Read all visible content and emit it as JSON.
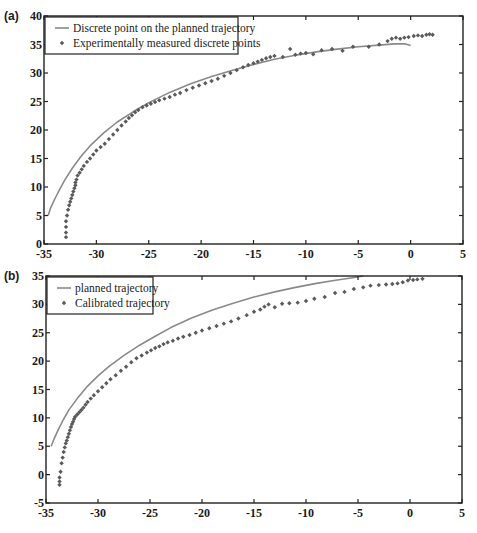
{
  "figure": {
    "panels": [
      "(a)",
      "(b)"
    ]
  },
  "colors": {
    "axis": "#222222",
    "line": "#8a8a8a",
    "marker": "#5a5a5a"
  },
  "chart_data": [
    {
      "type": "scatter",
      "panel_label": "(a)",
      "title": "",
      "xlabel": "",
      "ylabel": "",
      "xlim": [
        -35,
        5
      ],
      "ylim": [
        0,
        40
      ],
      "xticks": [
        -35,
        -30,
        -25,
        -20,
        -15,
        -10,
        -5,
        0,
        5
      ],
      "yticks": [
        0,
        5,
        10,
        15,
        20,
        25,
        30,
        35,
        40
      ],
      "grid": false,
      "legend_position": "upper left",
      "frame": {
        "left": 44,
        "right": 463,
        "top": 16,
        "bottom": 244
      },
      "legend": {
        "x": 45,
        "y": 17,
        "w": 193,
        "h": 37
      },
      "series": [
        {
          "name": "Discrete point on the planned trajectory",
          "kind": "line",
          "x": [
            -34.6,
            -34.4,
            -34.0,
            -33.5,
            -33.0,
            -32.3,
            -31.5,
            -30.5,
            -29.3,
            -28.0,
            -26.5,
            -25.0,
            -23.0,
            -21.0,
            -19.0,
            -17.0,
            -15.0,
            -13.0,
            -11.0,
            -9.0,
            -7.0,
            -5.0,
            -3.0,
            -1.5,
            -0.5,
            0.0
          ],
          "y": [
            5.0,
            6.2,
            7.8,
            9.6,
            11.3,
            13.3,
            15.3,
            17.4,
            19.5,
            21.4,
            23.2,
            24.8,
            26.6,
            28.1,
            29.4,
            30.5,
            31.5,
            32.4,
            33.1,
            33.7,
            34.2,
            34.6,
            34.9,
            35.1,
            35.1,
            34.8
          ]
        },
        {
          "name": "Experimentally measured discrete points",
          "kind": "scatter",
          "x": [
            -32.9,
            -32.9,
            -32.9,
            -32.9,
            -32.8,
            -32.7,
            -32.6,
            -32.5,
            -32.4,
            -32.3,
            -32.2,
            -32.1,
            -32.0,
            -32.0,
            -31.9,
            -31.8,
            -31.6,
            -31.4,
            -31.2,
            -30.9,
            -30.6,
            -30.3,
            -30.0,
            -29.6,
            -29.2,
            -28.8,
            -28.4,
            -28.0,
            -27.6,
            -27.2,
            -26.9,
            -26.6,
            -26.3,
            -26.0,
            -25.6,
            -25.2,
            -24.8,
            -24.4,
            -24.0,
            -23.5,
            -23.0,
            -22.5,
            -22.0,
            -21.4,
            -20.8,
            -20.2,
            -19.6,
            -19.0,
            -18.4,
            -17.8,
            -17.2,
            -16.6,
            -16.0,
            -15.5,
            -15.0,
            -14.6,
            -14.2,
            -13.8,
            -13.4,
            -13.0,
            -12.2,
            -11.5,
            -11.0,
            -10.5,
            -10.0,
            -9.3,
            -8.5,
            -7.5,
            -6.5,
            -5.5,
            -4.0,
            -3.0,
            -2.2,
            -1.8,
            -1.4,
            -1.0,
            -0.6,
            -0.2,
            0.3,
            0.7,
            1.1,
            1.5,
            1.8,
            2.1
          ],
          "y": [
            1.2,
            2.0,
            3.0,
            4.0,
            5.0,
            6.0,
            6.8,
            7.4,
            8.0,
            8.6,
            9.2,
            9.8,
            10.3,
            10.8,
            11.3,
            12.0,
            12.5,
            13.1,
            13.7,
            14.4,
            15.0,
            15.7,
            16.4,
            17.0,
            17.6,
            18.4,
            19.2,
            20.0,
            20.8,
            21.5,
            22.1,
            22.6,
            23.1,
            23.5,
            24.0,
            24.3,
            24.6,
            24.9,
            25.2,
            25.5,
            25.8,
            26.2,
            26.5,
            27.0,
            27.4,
            27.8,
            28.2,
            28.6,
            29.0,
            29.5,
            30.0,
            30.5,
            31.0,
            31.4,
            31.7,
            32.0,
            32.3,
            32.6,
            32.8,
            33.0,
            32.8,
            34.2,
            33.2,
            33.4,
            33.5,
            33.3,
            34.0,
            34.2,
            33.9,
            34.6,
            34.6,
            35.0,
            35.6,
            36.0,
            36.2,
            36.0,
            36.2,
            36.3,
            36.5,
            36.6,
            36.5,
            36.7,
            36.8,
            36.7
          ]
        }
      ]
    },
    {
      "type": "scatter",
      "panel_label": "(b)",
      "title": "",
      "xlabel": "",
      "ylabel": "",
      "xlim": [
        -35,
        5
      ],
      "ylim": [
        -5,
        35
      ],
      "xticks": [
        -35,
        -30,
        -25,
        -20,
        -15,
        -10,
        -5,
        0,
        5
      ],
      "yticks": [
        -5,
        0,
        5,
        10,
        15,
        20,
        25,
        30,
        35
      ],
      "grid": false,
      "legend_position": "upper left",
      "frame": {
        "left": 46,
        "right": 462,
        "top": 276,
        "bottom": 503
      },
      "legend": {
        "x": 47,
        "y": 277,
        "w": 106,
        "h": 37
      },
      "series": [
        {
          "name": "planned trajectory",
          "kind": "line",
          "x": [
            -34.5,
            -34.2,
            -33.8,
            -33.3,
            -32.8,
            -32.0,
            -31.0,
            -30.0,
            -29.0,
            -27.5,
            -26.0,
            -24.5,
            -23.0,
            -21.0,
            -19.0,
            -17.0,
            -15.0,
            -13.0,
            -11.0,
            -9.0,
            -7.0,
            -5.5,
            -4.5
          ],
          "y": [
            5.0,
            6.4,
            8.0,
            9.8,
            11.4,
            13.4,
            15.6,
            17.4,
            19.0,
            21.0,
            22.8,
            24.4,
            25.9,
            27.6,
            29.0,
            30.2,
            31.3,
            32.2,
            33.0,
            33.7,
            34.3,
            34.7,
            35.0
          ]
        },
        {
          "name": "Calibrated trajectory",
          "kind": "scatter",
          "x": [
            -33.7,
            -33.7,
            -33.7,
            -33.6,
            -33.5,
            -33.4,
            -33.3,
            -33.2,
            -33.1,
            -33.0,
            -32.9,
            -32.8,
            -32.7,
            -32.6,
            -32.5,
            -32.4,
            -32.3,
            -32.2,
            -32.0,
            -31.8,
            -31.6,
            -31.4,
            -31.2,
            -31.0,
            -30.7,
            -30.4,
            -30.0,
            -29.6,
            -29.2,
            -28.8,
            -28.3,
            -27.8,
            -27.3,
            -26.8,
            -26.3,
            -25.8,
            -25.3,
            -24.9,
            -24.5,
            -24.1,
            -23.7,
            -23.3,
            -22.8,
            -22.3,
            -21.8,
            -21.2,
            -20.6,
            -20.0,
            -19.3,
            -18.6,
            -17.9,
            -17.2,
            -16.5,
            -15.7,
            -15.0,
            -14.4,
            -14.0,
            -13.6,
            -13.0,
            -12.3,
            -11.6,
            -10.8,
            -10.0,
            -9.2,
            -8.2,
            -7.2,
            -6.3,
            -5.4,
            -4.5,
            -3.8,
            -3.0,
            -2.3,
            -1.7,
            -1.2,
            -0.7,
            -0.2,
            0.3,
            0.7,
            1.2
          ],
          "y": [
            -1.8,
            -1.2,
            -0.5,
            0.5,
            2.0,
            3.0,
            4.0,
            4.8,
            5.5,
            6.0,
            6.6,
            7.2,
            7.8,
            8.4,
            8.9,
            9.3,
            9.8,
            10.2,
            10.6,
            11.0,
            11.4,
            11.8,
            12.3,
            12.8,
            13.4,
            14.0,
            14.7,
            15.4,
            16.1,
            16.8,
            17.5,
            18.3,
            19.0,
            19.8,
            20.5,
            21.0,
            21.5,
            21.9,
            22.3,
            22.6,
            23.0,
            23.3,
            23.6,
            24.0,
            24.3,
            24.6,
            25.0,
            25.4,
            25.8,
            26.2,
            26.6,
            27.0,
            27.5,
            28.1,
            28.7,
            29.1,
            29.6,
            30.0,
            29.5,
            30.1,
            30.2,
            30.3,
            30.6,
            31.0,
            31.3,
            32.0,
            32.2,
            32.7,
            33.0,
            33.3,
            33.4,
            33.5,
            33.6,
            33.7,
            33.9,
            34.2,
            34.3,
            34.4,
            34.5
          ]
        }
      ]
    }
  ]
}
